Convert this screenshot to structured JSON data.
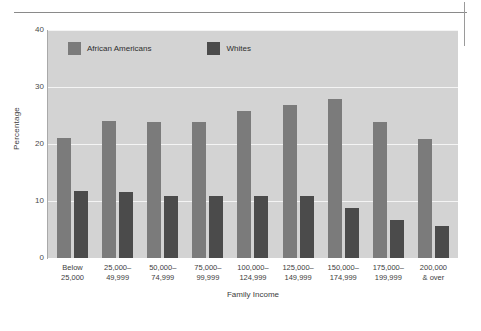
{
  "marks": {
    "horizontal_rule": "crop-rule",
    "vertical_rule": "crop-mark"
  },
  "chart_data": {
    "type": "bar",
    "title": "",
    "xlabel": "Family Income",
    "ylabel": "Percentage",
    "ylim": [
      0,
      40
    ],
    "yticks": [
      0,
      10,
      20,
      30,
      40
    ],
    "ytick_labels": [
      "0",
      "10",
      "20",
      "30",
      "40"
    ],
    "grid": true,
    "grid_axis": "y",
    "legend_position": "top-left-inside",
    "categories": [
      "Below 25,000",
      "25,000–49,999",
      "50,000–74,999",
      "75,000–99,999",
      "100,000–124,999",
      "125,000–149,999",
      "150,000–174,999",
      "175,000–199,999",
      "200,000 & over"
    ],
    "category_lines": [
      [
        "Below",
        "25,000"
      ],
      [
        "25,000–",
        "49,999"
      ],
      [
        "50,000–",
        "74,999"
      ],
      [
        "75,000–",
        "99,999"
      ],
      [
        "100,000–",
        "124,999"
      ],
      [
        "125,000–",
        "149,999"
      ],
      [
        "150,000–",
        "174,999"
      ],
      [
        "175,000–",
        "199,999"
      ],
      [
        "200,000",
        "& over"
      ]
    ],
    "series": [
      {
        "name": "African Americans",
        "color": "#7b7b7b",
        "values": [
          21.0,
          24.0,
          23.8,
          23.8,
          25.8,
          26.8,
          27.9,
          23.8,
          20.8
        ]
      },
      {
        "name": "Whites",
        "color": "#4b4b4b",
        "values": [
          11.7,
          11.6,
          10.8,
          10.8,
          10.8,
          10.8,
          8.7,
          6.7,
          5.7
        ]
      }
    ],
    "plot_background": "#d3d3d3",
    "gridline_color": "#f4f4f4"
  }
}
